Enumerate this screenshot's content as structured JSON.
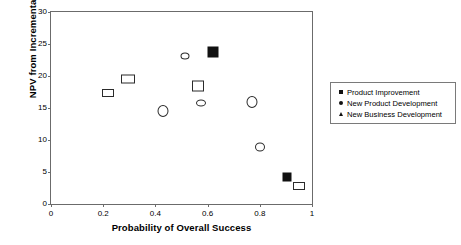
{
  "chart_data": {
    "type": "scatter",
    "title": "",
    "xlabel": "Probability of Overall Success",
    "ylabel": "NPV from Incremental Sales",
    "xlim": [
      0,
      1
    ],
    "ylim": [
      0,
      30
    ],
    "xticks": [
      "0",
      "0.2",
      "0.4",
      "0.6",
      "0.8",
      "1"
    ],
    "xtick_values": [
      0,
      0.2,
      0.4,
      0.6,
      0.8,
      1
    ],
    "yticks": [
      "0",
      "5",
      "10",
      "15",
      "20",
      "25",
      "30"
    ],
    "ytick_values": [
      0,
      5,
      10,
      15,
      20,
      25,
      30
    ],
    "grid": false,
    "legend_position": "right",
    "series": [
      {
        "name": "Product Improvement",
        "marker": "square",
        "points": [
          {
            "x": 0.62,
            "y": 23.7,
            "fill": "filled",
            "size": 11
          },
          {
            "x": 0.905,
            "y": 4.2,
            "fill": "filled",
            "size": 9
          },
          {
            "x": 0.22,
            "y": 17.3,
            "fill": "open",
            "size": 12,
            "height": 8
          },
          {
            "x": 0.295,
            "y": 19.6,
            "fill": "open",
            "size": 14,
            "height": 9
          },
          {
            "x": 0.565,
            "y": 18.5,
            "fill": "open",
            "size": 12,
            "height": 11
          },
          {
            "x": 0.95,
            "y": 2.8,
            "fill": "open",
            "size": 12,
            "height": 8
          }
        ]
      },
      {
        "name": "New Product Development",
        "marker": "circle",
        "points": [
          {
            "x": 0.515,
            "y": 23.1,
            "fill": "open",
            "size": 9,
            "height": 7
          },
          {
            "x": 0.43,
            "y": 14.5,
            "fill": "open",
            "size": 11,
            "height": 12
          },
          {
            "x": 0.575,
            "y": 15.8,
            "fill": "open",
            "size": 10,
            "height": 7
          },
          {
            "x": 0.77,
            "y": 16.0,
            "fill": "open",
            "size": 11,
            "height": 12
          },
          {
            "x": 0.8,
            "y": 8.9,
            "fill": "open",
            "size": 10,
            "height": 9
          }
        ]
      },
      {
        "name": "New  Business Development",
        "marker": "triangle",
        "points": []
      }
    ]
  },
  "legend": {
    "items": [
      {
        "label": "Product Improvement",
        "key": "square-marker-icon"
      },
      {
        "label": "New Product Development",
        "key": "circle-marker-icon"
      },
      {
        "label": "New  Business Development",
        "key": "triangle-marker-icon"
      }
    ]
  }
}
